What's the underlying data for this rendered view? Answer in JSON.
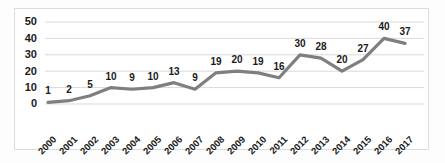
{
  "chart_data": {
    "type": "line",
    "title": "",
    "xlabel": "",
    "ylabel": "",
    "categories": [
      "2000",
      "2001",
      "2002",
      "2003",
      "2004",
      "2005",
      "2006",
      "2007",
      "2008",
      "2009",
      "2010",
      "2011",
      "2012",
      "2013",
      "2014",
      "2015",
      "2016",
      "2017"
    ],
    "values": [
      1,
      2,
      5,
      10,
      9,
      10,
      13,
      9,
      19,
      20,
      19,
      16,
      30,
      28,
      20,
      27,
      40,
      37
    ],
    "point_labels": [
      "1",
      "2",
      "5",
      "10",
      "9",
      "10",
      "13",
      "9",
      "19",
      "20",
      "19",
      "16",
      "30",
      "28",
      "20",
      "27",
      "40",
      "37"
    ],
    "ylim": [
      0,
      50
    ],
    "yticks": [
      0,
      10,
      20,
      30,
      40,
      50
    ],
    "ytick_labels": [
      "0",
      "10",
      "20",
      "30",
      "40",
      "50"
    ],
    "grid": "horizontal",
    "legend": "none",
    "series": [
      {
        "name": "",
        "color": "#7f7f7f",
        "values": [
          1,
          2,
          5,
          10,
          9,
          10,
          13,
          9,
          19,
          20,
          19,
          16,
          30,
          28,
          20,
          27,
          40,
          37
        ]
      }
    ],
    "annotations": [],
    "colors": {
      "line": "#7f7f7f",
      "grid": "#d9d9d9",
      "frame": "#dcdcdc",
      "text": "#1a1a1a",
      "background": "#ffffff"
    }
  }
}
